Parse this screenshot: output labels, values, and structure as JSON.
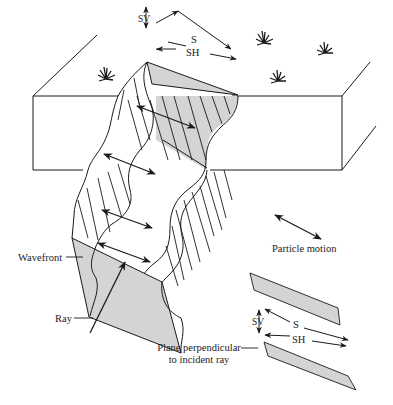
{
  "figure": {
    "colors": {
      "line": "#1a1a1a",
      "shaded_face": "#d4d4d4",
      "background": "#ffffff"
    },
    "labels": {
      "top_sv": "SV",
      "top_s": "S",
      "top_sh": "SH",
      "wavefront": "Wavefront",
      "ray": "Ray",
      "particle_motion": "Particle motion",
      "plane_line1": "Plane perpendicular",
      "plane_line2": "to incident ray",
      "bottom_sv": "SV",
      "bottom_s": "S",
      "bottom_sh": "SH"
    },
    "icons": [
      "grass-tuft-icon",
      "double-arrow-icon",
      "ray-arrow-icon"
    ]
  }
}
